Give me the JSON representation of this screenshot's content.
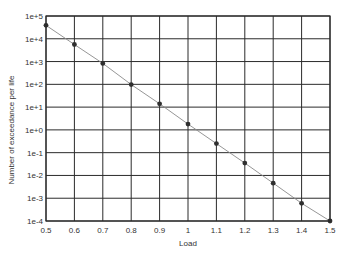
{
  "chart_data": {
    "type": "line",
    "title": "",
    "xlabel": "Load",
    "ylabel": "Number of exceedance per life",
    "yscale": "log",
    "xlim": [
      0.5,
      1.5
    ],
    "ylim": [
      0.0001,
      100000
    ],
    "grid": true,
    "legend": null,
    "x_ticks": [
      "0.5",
      "0.6",
      "0.7",
      "0.8",
      "0.9",
      "1",
      "1.1",
      "1.2",
      "1.3",
      "1.4",
      "1.5"
    ],
    "y_ticks": [
      "1e+5",
      "1e+4",
      "1e+3",
      "1e+2",
      "1e+1",
      "1e+0",
      "1e-1",
      "1e-2",
      "1e-3",
      "1e-4"
    ],
    "x": [
      0.5,
      0.6,
      0.7,
      0.8,
      0.9,
      1.0,
      1.1,
      1.2,
      1.3,
      1.4,
      1.5
    ],
    "series": [
      {
        "name": "exceedance",
        "values": [
          39000,
          5600,
          830,
          98,
          14,
          1.8,
          0.25,
          0.035,
          0.0046,
          0.0006,
          0.0001
        ],
        "marker": "circle",
        "line_color": "#8a8a8a",
        "marker_color": "#2f2f2f"
      }
    ]
  },
  "colors": {
    "grid": "#2b2b2b",
    "axes": "#2b2b2b",
    "text": "#333333"
  }
}
